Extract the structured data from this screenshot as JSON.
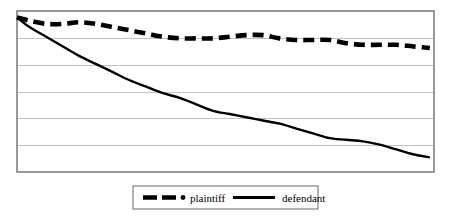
{
  "chart_data": {
    "type": "line",
    "title": "",
    "subtitle": "",
    "xlabel": "",
    "ylabel": "",
    "xlim": [
      0,
      100
    ],
    "ylim": [
      0,
      100
    ],
    "grid": true,
    "grid_axis": "y",
    "grid_color": "#c3c3c3",
    "y_gridline_values": [
      16.7,
      33.3,
      50,
      66.7,
      83.3
    ],
    "x_tick_labels": [],
    "y_tick_labels": [],
    "legend": {
      "position": "bottom-center",
      "border": true,
      "entries": [
        {
          "label": "plaintiff",
          "style": "dashed",
          "color": "#000000"
        },
        {
          "label": "defendant",
          "style": "solid",
          "color": "#000000"
        }
      ]
    },
    "plot_border_color": "#808080",
    "series": [
      {
        "name": "plaintiff",
        "style": "dashed",
        "color": "#000000",
        "x": [
          0,
          3,
          7,
          11,
          15,
          19,
          23,
          27,
          31,
          35,
          39,
          43,
          47,
          51,
          55,
          59,
          63,
          67,
          71,
          75,
          79,
          83,
          87,
          91,
          95,
          99
        ],
        "y": [
          96,
          94,
          92,
          92,
          93,
          92,
          90,
          88,
          86,
          84,
          83,
          83,
          83,
          84,
          85,
          85,
          83,
          82,
          82,
          82,
          80,
          79,
          79,
          79,
          78,
          77
        ]
      },
      {
        "name": "defendant",
        "style": "solid",
        "color": "#000000",
        "x": [
          0,
          3,
          7,
          11,
          15,
          19,
          23,
          27,
          31,
          35,
          39,
          43,
          47,
          51,
          55,
          59,
          63,
          67,
          71,
          75,
          79,
          83,
          87,
          91,
          95,
          99
        ],
        "y": [
          96,
          90,
          84,
          78,
          72,
          67,
          62,
          57,
          53,
          49,
          46,
          42,
          38,
          36,
          34,
          32,
          30,
          27,
          24,
          21,
          20,
          19,
          17,
          14,
          11,
          9
        ]
      }
    ]
  }
}
